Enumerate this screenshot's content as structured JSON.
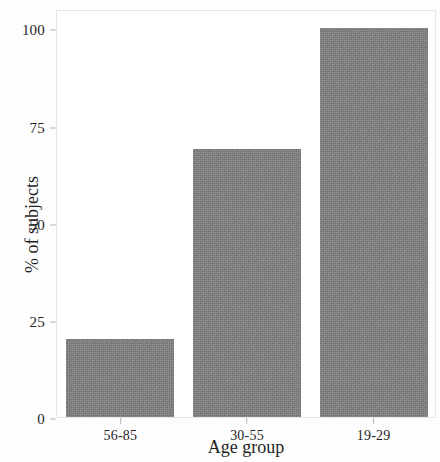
{
  "chart_data": {
    "type": "bar",
    "title": "",
    "subtitle": "",
    "categories": [
      "56-85",
      "30-55",
      "19-29"
    ],
    "values": [
      20,
      69,
      100
    ],
    "xlabel": "Age group",
    "ylabel": "% of subjects",
    "ylim": [
      0,
      105
    ],
    "yticks": [
      0,
      25,
      50,
      75,
      100
    ],
    "ytick_labels": [
      "0",
      "25",
      "50",
      "75",
      "100"
    ],
    "grid": false,
    "legend": null,
    "bar_color": "#7e7e7e",
    "frame_color": "#e6e6e6",
    "text_color": "#262626",
    "background": "#ffffff"
  },
  "axis": {
    "y_title": "% of subjects",
    "x_title": "Age group"
  }
}
